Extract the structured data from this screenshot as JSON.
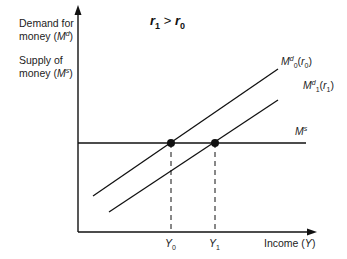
{
  "diagram": {
    "title": {
      "left": "r",
      "left_sub": "1",
      "op": ">",
      "right": "r",
      "right_sub": "0"
    },
    "y_axis": {
      "label_line1": "Demand for",
      "label_line2_prefix": "money (",
      "label_line2_sym": "M",
      "label_line2_sup": "d",
      "label_line2_suffix": ")",
      "label_line3": "Supply of",
      "label_line4_prefix": "money (",
      "label_line4_sym": "M",
      "label_line4_sup": "s",
      "label_line4_suffix": ")"
    },
    "x_axis": {
      "label_prefix": "Income (",
      "label_sym": "Y",
      "label_suffix": ")",
      "ticks": [
        {
          "sym": "Y",
          "sub": "0"
        },
        {
          "sym": "Y",
          "sub": "1"
        }
      ]
    },
    "curves": [
      {
        "sym": "M",
        "sup": "d",
        "sub": "0",
        "arg": "r",
        "arg_sub": "0"
      },
      {
        "sym": "M",
        "sup": "d",
        "sub": "1",
        "arg": "r",
        "arg_sub": "1"
      }
    ],
    "supply_line": {
      "sym": "M",
      "sup": "s"
    },
    "colors": {
      "ink": "#111111",
      "background": "#ffffff"
    }
  }
}
